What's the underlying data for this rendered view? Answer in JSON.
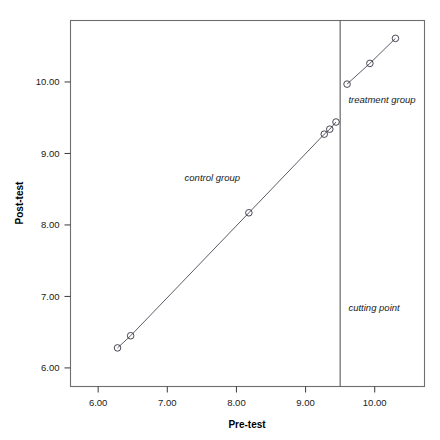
{
  "chart_data": {
    "type": "scatter",
    "title": "",
    "xlabel": "Pre-test",
    "ylabel": "Post-test",
    "xlim": [
      5.6,
      10.72
    ],
    "ylim": [
      5.74,
      10.86
    ],
    "xticks": [
      "6.00",
      "7.00",
      "8.00",
      "9.00",
      "10.00"
    ],
    "xtick_values": [
      6,
      7,
      8,
      9,
      10
    ],
    "yticks": [
      "6.00",
      "7.00",
      "8.00",
      "9.00",
      "10.00"
    ],
    "ytick_values": [
      6,
      7,
      8,
      9,
      10
    ],
    "grid": false,
    "legend": "none",
    "cutting_point": {
      "label": "cutting point",
      "x_value": 9.5
    },
    "series": [
      {
        "name": "control group",
        "label": "control group",
        "marker": "open-circle",
        "points": [
          {
            "x": 6.28,
            "y": 6.28
          },
          {
            "x": 6.47,
            "y": 6.45
          },
          {
            "x": 8.18,
            "y": 8.17
          },
          {
            "x": 9.27,
            "y": 9.27
          },
          {
            "x": 9.35,
            "y": 9.34
          },
          {
            "x": 9.44,
            "y": 9.44
          }
        ]
      },
      {
        "name": "treatment group",
        "label": "treatment group",
        "marker": "open-circle",
        "points": [
          {
            "x": 9.6,
            "y": 9.97
          },
          {
            "x": 9.93,
            "y": 10.26
          },
          {
            "x": 10.3,
            "y": 10.61
          }
        ]
      }
    ],
    "annotations": [
      {
        "text": "control group",
        "x": 7.25,
        "y": 8.62
      },
      {
        "text": "treatment group",
        "x": 9.62,
        "y": 9.7
      },
      {
        "text": "cutting point",
        "x": 9.62,
        "y": 6.8
      }
    ],
    "colors": {
      "frame": "#6e6e6e",
      "line": "#4a4a58",
      "marker_stroke": "#33333f",
      "cutline": "#5a5a5a",
      "text": "#1a1a1a",
      "background": "#ffffff"
    }
  }
}
